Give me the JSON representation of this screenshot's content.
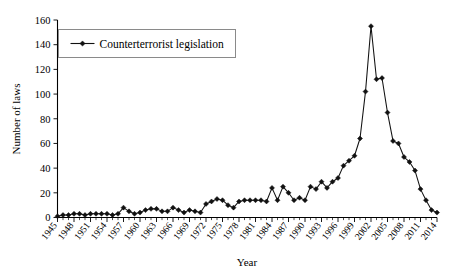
{
  "chart_data": {
    "type": "line",
    "title": "",
    "xlabel": "Year",
    "ylabel": "Number of laws",
    "xlim": [
      1945,
      2014
    ],
    "ylim": [
      0,
      160
    ],
    "ytick_step": 20,
    "xtick_step": 3,
    "grid": false,
    "legend_position": "top-left",
    "legend": [
      "Counterterrorist legislation"
    ],
    "yticks": [
      0,
      20,
      40,
      60,
      80,
      100,
      120,
      140,
      160
    ],
    "xticks": [
      1945,
      1948,
      1951,
      1954,
      1957,
      1960,
      1963,
      1966,
      1969,
      1972,
      1975,
      1978,
      1981,
      1984,
      1987,
      1990,
      1993,
      1996,
      1999,
      2002,
      2005,
      2008,
      2011,
      2014
    ],
    "marker": "diamond",
    "line_color": "#111111",
    "series": [
      {
        "name": "Counterterrorist legislation",
        "x": [
          1945,
          1946,
          1947,
          1948,
          1949,
          1950,
          1951,
          1952,
          1953,
          1954,
          1955,
          1956,
          1957,
          1958,
          1959,
          1960,
          1961,
          1962,
          1963,
          1964,
          1965,
          1966,
          1967,
          1968,
          1969,
          1970,
          1971,
          1972,
          1973,
          1974,
          1975,
          1976,
          1977,
          1978,
          1979,
          1980,
          1981,
          1982,
          1983,
          1984,
          1985,
          1986,
          1987,
          1988,
          1989,
          1990,
          1991,
          1992,
          1993,
          1994,
          1995,
          1996,
          1997,
          1998,
          1999,
          2000,
          2001,
          2002,
          2003,
          2004,
          2005,
          2006,
          2007,
          2008,
          2009,
          2010,
          2011,
          2012,
          2013,
          2014
        ],
        "values": [
          1,
          2,
          2,
          3,
          3,
          2,
          3,
          3,
          3,
          3,
          2,
          3,
          8,
          5,
          3,
          4,
          6,
          7,
          7,
          5,
          5,
          8,
          6,
          4,
          6,
          5,
          4,
          11,
          13,
          15,
          14,
          10,
          8,
          13,
          14,
          14,
          14,
          14,
          13,
          24,
          14,
          25,
          20,
          14,
          16,
          14,
          25,
          23,
          29,
          24,
          29,
          32,
          42,
          46,
          50,
          64,
          102,
          155,
          112,
          113,
          85,
          62,
          60,
          49,
          45,
          38,
          23,
          14,
          6,
          4
        ]
      }
    ]
  },
  "axes": {
    "ylabel": "Number of laws",
    "xlabel": "Year"
  },
  "legend": {
    "entries": [
      {
        "label": "Counterterrorist legislation",
        "marker": "diamond"
      }
    ]
  }
}
